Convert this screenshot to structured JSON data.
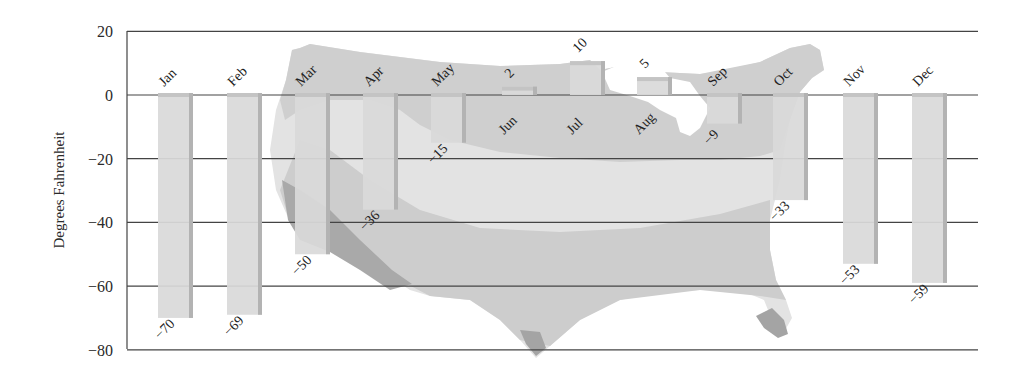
{
  "chart_data": {
    "type": "bar",
    "title": "",
    "xlabel": "",
    "ylabel": "Degrees Fahrenheit",
    "ylim": [
      -80,
      20
    ],
    "yticks": [
      20,
      0,
      -20,
      -40,
      -60,
      -80
    ],
    "ytick_labels": [
      "20",
      "0",
      "−20",
      "−40",
      "−60",
      "−80"
    ],
    "grid": true,
    "legend": null,
    "background": "US map silhouette shaded in gray temperature zones",
    "categories": [
      "Jan",
      "Feb",
      "Mar",
      "Apr",
      "May",
      "Jun",
      "Jul",
      "Aug",
      "Sep",
      "Oct",
      "Nov",
      "Dec"
    ],
    "series": [
      {
        "name": "Record low temperature",
        "values": [
          -70,
          -69,
          -50,
          -36,
          -15,
          2,
          10,
          5,
          -9,
          -33,
          -53,
          -59
        ],
        "value_labels": [
          "−70",
          "−69",
          "−50",
          "−36",
          "−15",
          "2",
          "10",
          "5",
          "−9",
          "−33",
          "−53",
          "−59"
        ]
      }
    ]
  },
  "colors": {
    "bar_fill": "#d9d9d9",
    "bar_shadow": "#b3b3b3",
    "bar_top": "#c4c4c4",
    "grid": "#444444",
    "map_light": "#e3e3e3",
    "map_mid": "#cfcfcf",
    "map_dark": "#b4b4b4",
    "map_darkest": "#9e9e9e"
  }
}
